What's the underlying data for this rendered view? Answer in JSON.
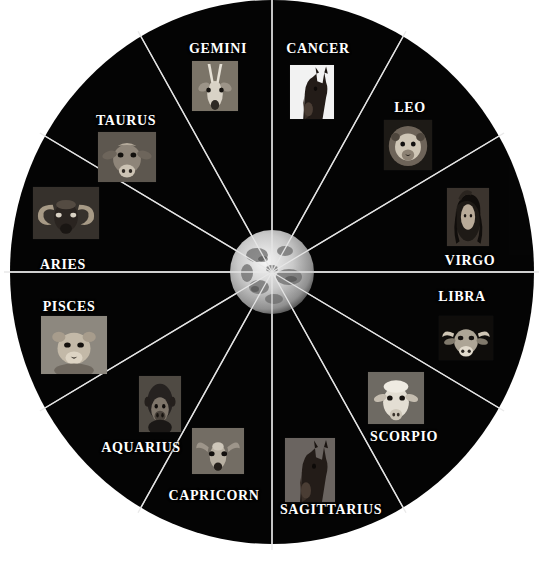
{
  "figure": {
    "background_color": "#ffffff",
    "wheel_fill": "#050505",
    "divider_color": "#d8d8d8",
    "label_color": "#ffffff"
  },
  "wheel": {
    "center_x": 272,
    "center_y": 272,
    "radius_x": 262,
    "radius_y": 272,
    "segment_count": 12,
    "center_body": "moon"
  },
  "signs": [
    {
      "name": "GEMINI",
      "animal": "antelope",
      "label_x": 218,
      "label_y": 49,
      "thumb_x": 215,
      "thumb_y": 86,
      "thumb_w": 46,
      "thumb_h": 50,
      "thumb_bg": "#6d6d6d",
      "segment_index": 0
    },
    {
      "name": "CANCER",
      "animal": "horse",
      "label_x": 318,
      "label_y": 49,
      "thumb_x": 312,
      "thumb_y": 92,
      "thumb_w": 44,
      "thumb_h": 54,
      "thumb_bg": "#f2f2f2",
      "segment_index": 1
    },
    {
      "name": "LEO",
      "animal": "lion",
      "label_x": 410,
      "label_y": 108,
      "thumb_x": 408,
      "thumb_y": 145,
      "thumb_w": 48,
      "thumb_h": 50,
      "thumb_bg": "#585858",
      "segment_index": 2
    },
    {
      "name": "VIRGO",
      "animal": "woman",
      "label_x": 470,
      "label_y": 261,
      "thumb_x": 468,
      "thumb_y": 217,
      "thumb_w": 42,
      "thumb_h": 58,
      "thumb_bg": "#4a4440",
      "segment_index": 3
    },
    {
      "name": "LIBRA",
      "animal": "ox",
      "label_x": 462,
      "label_y": 297,
      "thumb_x": 466,
      "thumb_y": 338,
      "thumb_w": 54,
      "thumb_h": 44,
      "thumb_bg": "#5e5a55",
      "segment_index": 4
    },
    {
      "name": "SCORPIO",
      "animal": "sheep",
      "label_x": 404,
      "label_y": 437,
      "thumb_x": 396,
      "thumb_y": 398,
      "thumb_w": 56,
      "thumb_h": 52,
      "thumb_bg": "#8e8a84",
      "segment_index": 5
    },
    {
      "name": "SAGITTARIUS",
      "animal": "horse",
      "label_x": 331,
      "label_y": 510,
      "thumb_x": 310,
      "thumb_y": 470,
      "thumb_w": 50,
      "thumb_h": 64,
      "thumb_bg": "#6a6460",
      "segment_index": 6
    },
    {
      "name": "CAPRICORN",
      "animal": "deer",
      "label_x": 214,
      "label_y": 496,
      "thumb_x": 218,
      "thumb_y": 451,
      "thumb_w": 52,
      "thumb_h": 46,
      "thumb_bg": "#7b766f",
      "segment_index": 7
    },
    {
      "name": "AQUARIUS",
      "animal": "gorilla",
      "label_x": 141,
      "label_y": 448,
      "thumb_x": 160,
      "thumb_y": 404,
      "thumb_w": 42,
      "thumb_h": 56,
      "thumb_bg": "#5a5650",
      "segment_index": 8
    },
    {
      "name": "PISCES",
      "animal": "lion-cub",
      "label_x": 69,
      "label_y": 307,
      "thumb_x": 74,
      "thumb_y": 345,
      "thumb_w": 66,
      "thumb_h": 58,
      "thumb_bg": "#8a857d",
      "segment_index": 9
    },
    {
      "name": "ARIES",
      "animal": "ram",
      "label_x": 63,
      "label_y": 265,
      "thumb_x": 66,
      "thumb_y": 213,
      "thumb_w": 66,
      "thumb_h": 52,
      "thumb_bg": "#4d4944",
      "segment_index": 10
    },
    {
      "name": "TAURUS",
      "animal": "cow",
      "label_x": 126,
      "label_y": 121,
      "thumb_x": 127,
      "thumb_y": 157,
      "thumb_w": 58,
      "thumb_h": 50,
      "thumb_bg": "#78736c",
      "segment_index": 11
    }
  ]
}
